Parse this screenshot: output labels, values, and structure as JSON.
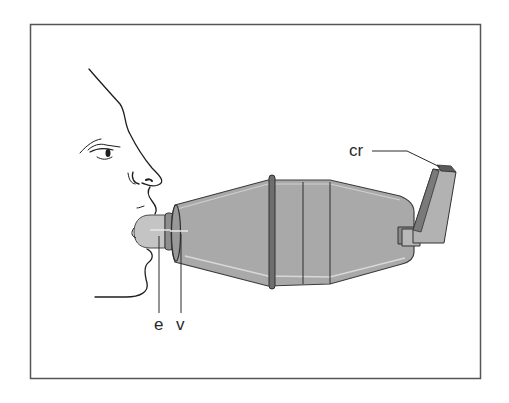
{
  "figure": {
    "labels": {
      "e": "e",
      "v": "v",
      "cr": "cr"
    },
    "parts": [
      {
        "key": "e",
        "name": "mouthpiece"
      },
      {
        "key": "v",
        "name": "valve"
      },
      {
        "key": "cr",
        "name": "inhaler canister"
      }
    ],
    "colors": {
      "frame": "#555555",
      "chamber_fill": "#a9a9a9",
      "chamber_outline": "#3c3c3c",
      "ring": "#6e6e6e",
      "canister_dark": "#7a7a7a",
      "canister_light": "#b2b2b2",
      "mouthpiece": "#c4c4c4",
      "face_line": "#1e1e1e"
    }
  }
}
